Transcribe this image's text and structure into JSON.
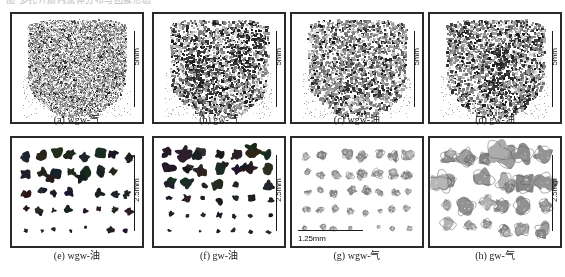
{
  "figure": {
    "top_cut_text": "图 多孔介质内流体分布与团簇形态",
    "rows": [
      {
        "name": "top-row",
        "panels": [
          {
            "id": "a",
            "caption": "(a)  wgw-气",
            "scalebar": {
              "label": "5mm",
              "orientation": "vertical",
              "position": "right"
            },
            "render": {
              "style": "cloud",
              "density": 0.52,
              "dark": 0.1,
              "mid": 0.55,
              "seed": 11,
              "grain": 1,
              "cluster_count": 0
            }
          },
          {
            "id": "b",
            "caption": "(b)  gw-气",
            "scalebar": {
              "label": "5mm",
              "orientation": "vertical",
              "position": "right"
            },
            "render": {
              "style": "cloud",
              "density": 0.46,
              "dark": 0.3,
              "mid": 0.45,
              "seed": 23,
              "grain": 2,
              "cluster_count": 7
            }
          },
          {
            "id": "c",
            "caption": "(c)  wgw-油",
            "scalebar": {
              "label": "5mm",
              "orientation": "vertical",
              "position": "right"
            },
            "render": {
              "style": "cloud",
              "density": 0.44,
              "dark": 0.18,
              "mid": 0.62,
              "seed": 37,
              "grain": 2,
              "cluster_count": 4
            }
          },
          {
            "id": "d",
            "caption": "(d)  gw-油",
            "scalebar": {
              "label": "5mm",
              "orientation": "vertical",
              "position": "right"
            },
            "render": {
              "style": "cloud",
              "density": 0.5,
              "dark": 0.26,
              "mid": 0.55,
              "seed": 53,
              "grain": 2,
              "cluster_count": 6
            }
          }
        ]
      },
      {
        "name": "bottom-row",
        "panels": [
          {
            "id": "e",
            "caption": "(e)  wgw-油",
            "scalebar": {
              "label": "2.5mm",
              "orientation": "vertical",
              "position": "right"
            },
            "render": {
              "style": "blobs",
              "tone": "dark",
              "seed": 71,
              "rows": 5,
              "cols": 8,
              "size_top": 1.0,
              "size_bottom": 0.42
            }
          },
          {
            "id": "f",
            "caption": "(f)  gw-油",
            "scalebar": {
              "label": "2.5mm",
              "orientation": "vertical",
              "position": "right"
            },
            "render": {
              "style": "blobs",
              "tone": "dark",
              "seed": 89,
              "rows": 6,
              "cols": 7,
              "size_top": 1.0,
              "size_bottom": 0.3
            }
          },
          {
            "id": "g",
            "caption": "(g)  wgw-气",
            "scalebar": {
              "label": "1.25mm",
              "orientation": "horizontal",
              "position": "bottom-left"
            },
            "render": {
              "style": "blobs",
              "tone": "light",
              "seed": 101,
              "rows": 5,
              "cols": 8,
              "size_top": 0.75,
              "size_bottom": 0.38
            }
          },
          {
            "id": "h",
            "caption": "(h)  gw-气",
            "scalebar": {
              "label": "2.5mm",
              "orientation": "vertical",
              "position": "right"
            },
            "render": {
              "style": "blobs",
              "tone": "light",
              "seed": 131,
              "rows": 4,
              "cols": 6,
              "size_top": 1.25,
              "size_bottom": 0.75
            }
          }
        ]
      }
    ]
  }
}
